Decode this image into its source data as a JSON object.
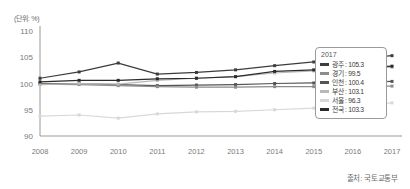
{
  "unit_label": "(단위: %)",
  "source_note": "출처: 국토교통부",
  "legend": {
    "title": "2017",
    "items": [
      {
        "name": "광주",
        "value": "105.3",
        "label": "광주 : 105.3",
        "color": "#3d3d3d"
      },
      {
        "name": "경기",
        "value": "99.5",
        "label": "경기 : 99.5",
        "color": "#8c8c8c"
      },
      {
        "name": "인천",
        "value": "100.4",
        "label": "인천 : 100.4",
        "color": "#555555"
      },
      {
        "name": "부산",
        "value": "103.1",
        "label": "부산 : 103.1",
        "color": "#b8b8b8"
      },
      {
        "name": "서울",
        "value": "96.3",
        "label": "서울 : 96.3",
        "color": "#d8d8d8"
      },
      {
        "name": "전국",
        "value": "103.3",
        "label": "전국 : 103.3",
        "color": "#2b2b2b"
      }
    ]
  },
  "chart_data": {
    "type": "line",
    "title": "",
    "xlabel": "",
    "ylabel": "",
    "unit": "%",
    "grid": false,
    "legend_position": "inside-right",
    "ylim": [
      90,
      110
    ],
    "yticks": [
      90,
      95,
      100,
      105,
      110
    ],
    "ytick_labels": [
      "90",
      "95",
      "100",
      "105",
      "110"
    ],
    "x": [
      2008,
      2009,
      2010,
      2011,
      2012,
      2013,
      2014,
      2015,
      2016,
      2017
    ],
    "xtick_labels": [
      "2008",
      "2009",
      "2010",
      "2011",
      "2012",
      "2013",
      "2014",
      "2015",
      "2016",
      "2017"
    ],
    "series": [
      {
        "name": "광주",
        "color": "#3d3d3d",
        "values": [
          101.0,
          102.2,
          103.9,
          101.8,
          102.1,
          102.6,
          103.4,
          104.1,
          104.7,
          105.3
        ]
      },
      {
        "name": "전국",
        "color": "#2b2b2b",
        "values": [
          100.3,
          100.6,
          100.6,
          100.9,
          101.0,
          101.3,
          102.3,
          102.6,
          102.9,
          103.3
        ]
      },
      {
        "name": "부산",
        "color": "#b8b8b8",
        "values": [
          99.8,
          100.0,
          99.9,
          100.6,
          101.0,
          101.3,
          102.0,
          102.4,
          102.8,
          103.1
        ]
      },
      {
        "name": "인천",
        "color": "#555555",
        "values": [
          100.0,
          100.0,
          99.8,
          99.6,
          99.7,
          99.8,
          100.0,
          100.1,
          100.2,
          100.4
        ]
      },
      {
        "name": "경기",
        "color": "#8c8c8c",
        "values": [
          99.9,
          99.8,
          99.6,
          99.4,
          99.3,
          99.3,
          99.4,
          99.4,
          99.5,
          99.5
        ]
      },
      {
        "name": "서울",
        "color": "#d8d8d8",
        "values": [
          93.8,
          94.0,
          93.4,
          94.2,
          94.6,
          94.7,
          95.0,
          95.3,
          95.8,
          96.3
        ]
      }
    ]
  }
}
